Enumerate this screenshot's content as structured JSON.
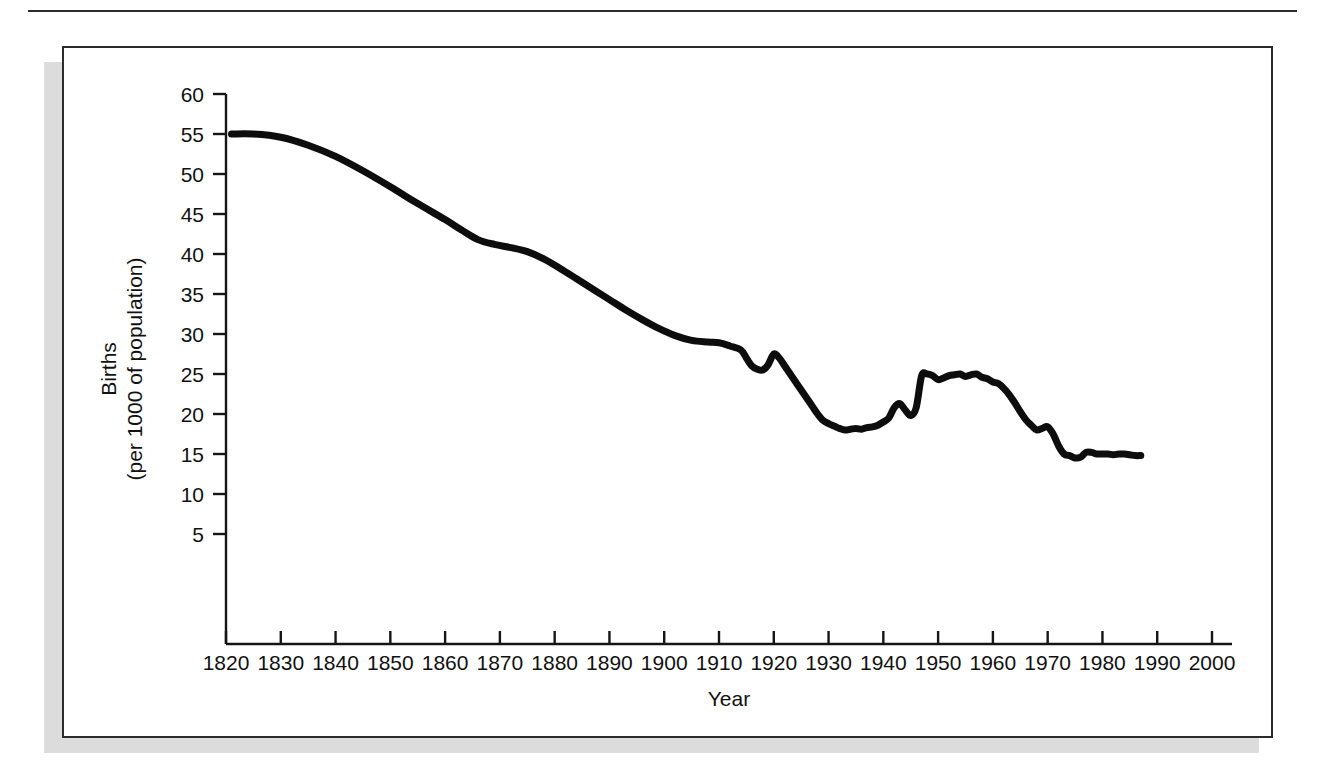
{
  "figure": {
    "frame_border_color": "#2b2b2b",
    "shadow_color": "#dcdcdc",
    "background_color": "#ffffff"
  },
  "chart_data": {
    "type": "line",
    "title": "",
    "xlabel": "Year",
    "ylabel": "Births\n(per 1000 of population)",
    "ylabel_line1": "Births",
    "ylabel_line2": "(per 1000 of population)",
    "xlim": [
      1820,
      2000
    ],
    "ylim": [
      0,
      60
    ],
    "grid": false,
    "legend": "none",
    "line_color": "#0d0d0d",
    "x_ticks": [
      1820,
      1830,
      1840,
      1850,
      1860,
      1870,
      1880,
      1890,
      1900,
      1910,
      1920,
      1930,
      1940,
      1950,
      1960,
      1970,
      1980,
      1990,
      2000
    ],
    "x_tick_labels": [
      "1820",
      "1830",
      "1840",
      "1850",
      "1860",
      "1870",
      "1880",
      "1890",
      "1900",
      "1910",
      "1920",
      "1930",
      "1940",
      "1950",
      "1960",
      "1970",
      "1980",
      "1990",
      "2000"
    ],
    "y_ticks": [
      5,
      10,
      15,
      20,
      25,
      30,
      35,
      40,
      45,
      50,
      55,
      60
    ],
    "y_tick_labels": [
      "5",
      "10",
      "15",
      "20",
      "25",
      "30",
      "35",
      "40",
      "45",
      "50",
      "55",
      "60"
    ],
    "series": [
      {
        "name": "Birth rate",
        "x": [
          1821,
          1825,
          1830,
          1835,
          1840,
          1845,
          1850,
          1855,
          1860,
          1863,
          1866,
          1869,
          1872,
          1875,
          1878,
          1881,
          1884,
          1887,
          1890,
          1893,
          1896,
          1899,
          1902,
          1905,
          1908,
          1910,
          1912,
          1914,
          1915,
          1916,
          1917,
          1918,
          1919,
          1920,
          1921,
          1922,
          1923,
          1924,
          1925,
          1926,
          1927,
          1928,
          1929,
          1930,
          1931,
          1932,
          1933,
          1934,
          1935,
          1936,
          1937,
          1938,
          1939,
          1940,
          1941,
          1942,
          1943,
          1944,
          1945,
          1946,
          1947,
          1948,
          1949,
          1950,
          1951,
          1952,
          1953,
          1954,
          1955,
          1956,
          1957,
          1958,
          1959,
          1960,
          1961,
          1962,
          1963,
          1964,
          1965,
          1966,
          1967,
          1968,
          1969,
          1970,
          1971,
          1972,
          1973,
          1974,
          1975,
          1976,
          1977,
          1978,
          1979,
          1980,
          1981,
          1982,
          1983,
          1984,
          1985,
          1986,
          1987
        ],
        "y": [
          55.0,
          55.0,
          54.6,
          53.6,
          52.2,
          50.4,
          48.4,
          46.3,
          44.3,
          43.0,
          41.8,
          41.2,
          40.8,
          40.3,
          39.4,
          38.2,
          36.9,
          35.6,
          34.3,
          33.0,
          31.8,
          30.7,
          29.8,
          29.2,
          29.0,
          28.9,
          28.5,
          28.0,
          27.0,
          26.0,
          25.6,
          25.5,
          26.2,
          27.5,
          27.0,
          26.0,
          25.0,
          24.0,
          23.0,
          22.0,
          21.0,
          20.0,
          19.2,
          18.8,
          18.5,
          18.2,
          18.0,
          18.1,
          18.2,
          18.1,
          18.3,
          18.4,
          18.6,
          19.0,
          19.5,
          20.8,
          21.3,
          20.5,
          19.8,
          20.8,
          24.8,
          25.0,
          24.8,
          24.3,
          24.5,
          24.8,
          24.9,
          25.0,
          24.7,
          24.9,
          25.0,
          24.6,
          24.4,
          24.0,
          23.8,
          23.2,
          22.4,
          21.4,
          20.3,
          19.3,
          18.6,
          18.0,
          18.2,
          18.4,
          17.5,
          16.0,
          15.0,
          14.8,
          14.5,
          14.6,
          15.2,
          15.2,
          15.0,
          15.0,
          15.0,
          14.9,
          15.0,
          15.0,
          14.9,
          14.8,
          14.8
        ]
      }
    ],
    "annotations": []
  }
}
